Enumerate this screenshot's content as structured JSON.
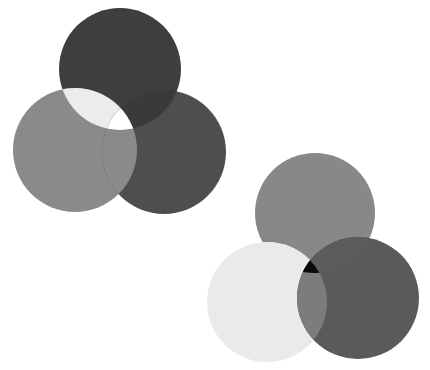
{
  "canvas": {
    "width": 430,
    "height": 370,
    "background": "#ffffff"
  },
  "groups": [
    {
      "name": "venn-group-top-left",
      "circles": [
        {
          "id": "top",
          "cx": 120,
          "cy": 69,
          "r": 61,
          "fill": "#3e3e3e"
        },
        {
          "id": "left",
          "cx": 75,
          "cy": 150,
          "r": 62,
          "fill": "#8a8a8a"
        },
        {
          "id": "right",
          "cx": 164,
          "cy": 152,
          "r": 62,
          "fill": "#4e4e4e"
        }
      ],
      "overlaps": {
        "top_left": "#ececec",
        "top_right": "#3a3a3a",
        "left_right": "#8a8a8a",
        "all": "#ffffff"
      }
    },
    {
      "name": "venn-group-bottom-right",
      "circles": [
        {
          "id": "top",
          "cx": 315,
          "cy": 213,
          "r": 60,
          "fill": "#888888"
        },
        {
          "id": "left",
          "cx": 267,
          "cy": 302,
          "r": 60,
          "fill": "#eaeaea"
        },
        {
          "id": "right",
          "cx": 358,
          "cy": 298,
          "r": 61,
          "fill": "#5a5a5a"
        }
      ],
      "overlaps": {
        "top_left": "#eaeaea",
        "top_right": "#5c5c5c",
        "left_right": "#7c7c7c",
        "all": "#0a0a0a"
      }
    }
  ]
}
